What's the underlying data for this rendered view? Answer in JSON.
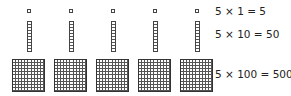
{
  "diagram": {
    "groups": 5,
    "units": {
      "count": 5,
      "value_each": 1
    },
    "rods": {
      "count": 5,
      "value_each": 10
    },
    "flats": {
      "count": 5,
      "value_each": 100
    },
    "equations": [
      {
        "label": "5 × 1 = 5"
      },
      {
        "label": "5 × 10 = 50"
      },
      {
        "label": "5 × 100 = 500"
      }
    ],
    "colors": {
      "stroke": "#444444",
      "background": "#ffffff",
      "text": "#222222"
    }
  }
}
